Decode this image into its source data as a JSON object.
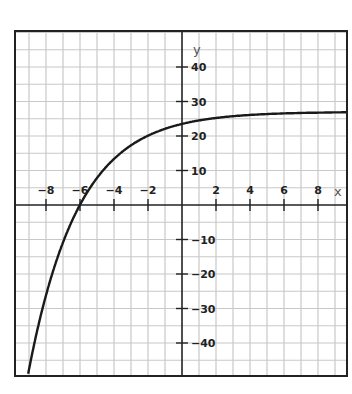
{
  "chart_data": {
    "type": "line",
    "title": "",
    "xlabel": "x",
    "ylabel": "y",
    "xlim": [
      -9.8,
      9.8
    ],
    "ylim": [
      -50,
      50
    ],
    "grid": true,
    "grid_spacing": {
      "x": 1,
      "y": 5
    },
    "x_ticks": [
      -8,
      -6,
      -4,
      -2,
      2,
      4,
      6,
      8
    ],
    "x_tick_labels": [
      "−8",
      "−6",
      "−4",
      "−2",
      "2",
      "4",
      "6",
      "8"
    ],
    "y_ticks": [
      40,
      30,
      20,
      10,
      -10,
      -20,
      -30,
      -40
    ],
    "y_tick_labels": [
      "40",
      "30",
      "20",
      "10",
      "−10",
      "−20",
      "−30",
      "−40"
    ],
    "legend": null,
    "series": [
      {
        "name": "curve",
        "description": "Increasing curve approaching horizontal asymptote near y = 27; y-intercept ≈ 23.5; x-intercept ≈ −6",
        "x": [
          -8.7,
          -8,
          -7,
          -6,
          -5,
          -4,
          -3,
          -2,
          -1,
          0,
          1,
          2,
          4,
          6,
          8,
          9.8
        ],
        "y": [
          -40,
          -28,
          -14,
          0,
          7.8,
          13.4,
          17.3,
          20.1,
          22.1,
          23.5,
          24.5,
          25.2,
          26.1,
          26.5,
          26.8,
          26.9
        ]
      }
    ]
  },
  "colors": {
    "grid": "#c8c8c8",
    "axis": "#222222",
    "curve": "#1a1a1a",
    "frame": "#222222",
    "background": "#ffffff"
  }
}
